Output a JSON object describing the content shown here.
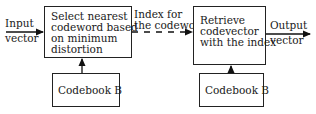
{
  "diagram": {
    "type": "block-diagram",
    "title": "",
    "input_label": [
      "Input",
      "vector"
    ],
    "output_label": [
      "Output",
      "vector"
    ],
    "edge_label": [
      "Index for",
      "the codeword"
    ],
    "encoder_block": [
      "Select nearest",
      "codeword based",
      "on minimum",
      "distortion"
    ],
    "decoder_block": [
      "Retrieve",
      "codevector",
      "with the index"
    ],
    "codebook_left": "Codebook B",
    "codebook_right": "Codebook B"
  },
  "nodes": [
    {
      "id": "encoder",
      "label": "Select nearest codeword based on minimum distortion"
    },
    {
      "id": "codebook1",
      "label": "Codebook B"
    },
    {
      "id": "decoder",
      "label": "Retrieve codevector with the index"
    },
    {
      "id": "codebook2",
      "label": "Codebook B"
    }
  ],
  "edges": [
    {
      "from": "input",
      "to": "encoder",
      "label": "Input vector",
      "style": "solid"
    },
    {
      "from": "codebook1",
      "to": "encoder",
      "label": "",
      "style": "solid"
    },
    {
      "from": "encoder",
      "to": "decoder",
      "label": "Index for the codeword",
      "style": "dashed"
    },
    {
      "from": "codebook2",
      "to": "decoder",
      "label": "",
      "style": "solid"
    },
    {
      "from": "decoder",
      "to": "output",
      "label": "Output vector",
      "style": "solid"
    }
  ]
}
